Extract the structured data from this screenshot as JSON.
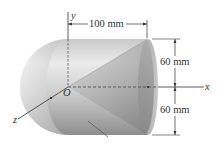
{
  "figure": {
    "axes": {
      "x_label": "x",
      "y_label": "y",
      "z_label": "z",
      "origin_label": "O"
    },
    "dimensions": {
      "length": "100 mm",
      "upper_radius": "60 mm",
      "lower_radius": "60 mm"
    },
    "colors": {
      "background": "#ffffff",
      "body_light": "#e6e6e6",
      "body_dark": "#8c8c8c",
      "lines": "#333333"
    }
  }
}
